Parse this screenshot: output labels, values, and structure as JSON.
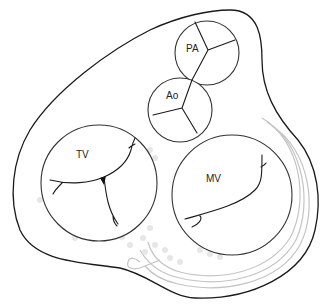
{
  "diagram": {
    "valves": [
      {
        "id": "pa",
        "label": "PA",
        "name": "Pulmonary artery valve"
      },
      {
        "id": "ao",
        "label": "Ao",
        "name": "Aortic valve"
      },
      {
        "id": "tv",
        "label": "TV",
        "name": "Tricuspid valve"
      },
      {
        "id": "mv",
        "label": "MV",
        "name": "Mitral valve"
      }
    ],
    "colors": {
      "outline": "#1a1a1a",
      "valve_stroke": "#333333",
      "coronary_sinus": "#c4c4c4",
      "markers": "#e6e6e6",
      "background": "#ffffff"
    }
  }
}
